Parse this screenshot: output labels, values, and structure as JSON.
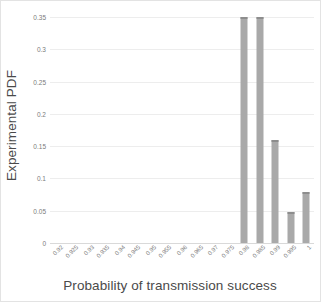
{
  "chart_data": {
    "type": "bar",
    "title": "",
    "xlabel": "Probability of transmission success",
    "ylabel": "Experimental PDF",
    "categories": [
      "0.92",
      "0.925",
      "0.93",
      "0.935",
      "0.94",
      "0.945",
      "0.95",
      "0.955",
      "0.96",
      "0.965",
      "0.97",
      "0.975",
      "0.98",
      "0.985",
      "0.99",
      "0.995",
      "1"
    ],
    "values": [
      0,
      0,
      0,
      0,
      0,
      0,
      0,
      0,
      0,
      0,
      0,
      0,
      0.35,
      0.35,
      0.16,
      0.048,
      0.079
    ],
    "ylim": [
      0,
      0.35
    ],
    "yticks": [
      "0",
      "0.05",
      "0.1",
      "0.15",
      "0.2",
      "0.25",
      "0.3",
      "0.35"
    ],
    "ytick_values": [
      0,
      0.05,
      0.1,
      0.15,
      0.2,
      0.25,
      0.3,
      0.35
    ],
    "grid": true,
    "legend": false,
    "bar_color": "#a9a9a9",
    "gridline_color": "#ededed",
    "axis_color": "#d9d9d9",
    "label_color": "#7b7b7b",
    "title_color": "#4a4a4a"
  }
}
